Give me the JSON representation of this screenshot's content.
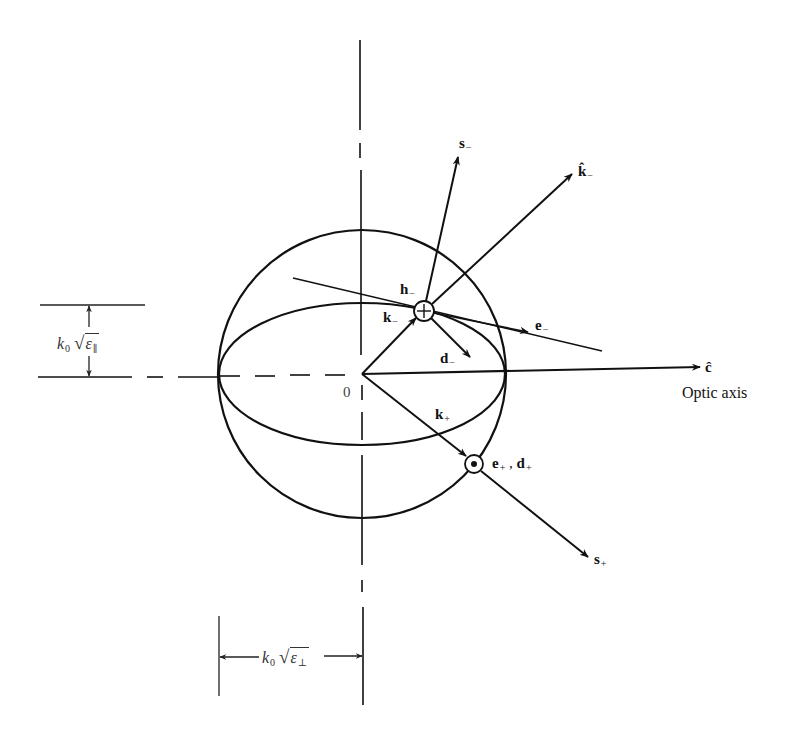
{
  "diagram": {
    "origin_label": "0",
    "optic_axis": {
      "vector_label": "ĉ",
      "caption": "Optic axis"
    },
    "vectors": {
      "s_minus": {
        "base": "s",
        "sub": "−"
      },
      "k_hat_minus": {
        "base": "k̂",
        "sub": "−"
      },
      "h_minus": {
        "base": "h",
        "sub": "−"
      },
      "k_minus": {
        "base": "k",
        "sub": "−"
      },
      "e_minus": {
        "base": "e",
        "sub": "−"
      },
      "d_minus": {
        "base": "d",
        "sub": "−"
      },
      "k_plus": {
        "base": "k",
        "sub": "+"
      },
      "e_plus_d_plus": {
        "e": "e",
        "e_sub": "+",
        "sep": " ,",
        "d": "d",
        "d_sub": "+"
      },
      "s_plus": {
        "base": "s",
        "sub": "+"
      }
    },
    "dimensions": {
      "parallel": {
        "k": "k",
        "k_sub": "0",
        "eps": "ε",
        "eps_sub": "∥"
      },
      "perpendicular": {
        "k": "k",
        "k_sub": "0",
        "eps": "ε",
        "eps_sub": "⊥"
      }
    },
    "symbols": {
      "into_page": "circled-cross-icon",
      "out_of_page": "circled-dot-icon"
    }
  }
}
